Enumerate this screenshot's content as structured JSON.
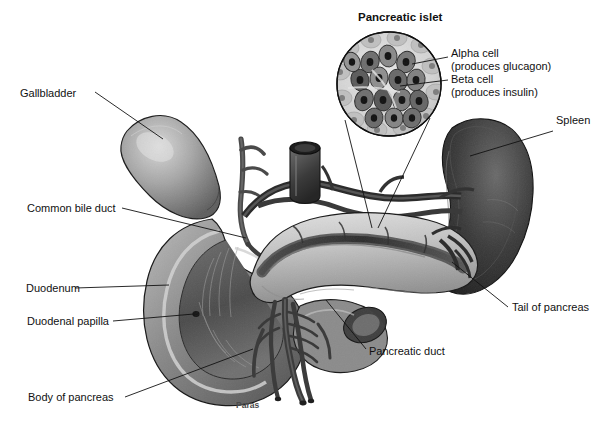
{
  "figure": {
    "title": "Pancreatic islet",
    "signature": "Paras",
    "background_color": "#ffffff",
    "ink_color": "#111111",
    "palette": {
      "line": "#1a1a1a",
      "spleen_dark": "#2e2e2e",
      "gallbladder_mid": "#8d8d8d",
      "duodenum_mid": "#7b7b7b",
      "pancreas_light": "#c9c9c9",
      "duct_dark": "#3c3c3c",
      "vessel_dark": "#4a4a4a",
      "islet_pale": "#d7d7d7"
    }
  },
  "inset": {
    "name": "pancreatic-islet-micrograph",
    "title": "Pancreatic islet",
    "callouts": [
      {
        "id": "alpha-cell",
        "line1": "Alpha cell",
        "line2": "(produces glucagon)"
      },
      {
        "id": "beta-cell",
        "line1": "Beta cell",
        "line2": "(produces insulin)"
      }
    ]
  },
  "labels": [
    {
      "id": "gallbladder",
      "text": "Gallbladder"
    },
    {
      "id": "common-bile-duct",
      "text": "Common bile duct"
    },
    {
      "id": "duodenum",
      "text": "Duodenum"
    },
    {
      "id": "duodenal-papilla",
      "text": "Duodenal papilla"
    },
    {
      "id": "body-of-pancreas",
      "text": "Body of pancreas"
    },
    {
      "id": "spleen",
      "text": "Spleen"
    },
    {
      "id": "tail-of-pancreas",
      "text": "Tail of pancreas"
    },
    {
      "id": "pancreatic-duct",
      "text": "Pancreatic duct"
    }
  ]
}
